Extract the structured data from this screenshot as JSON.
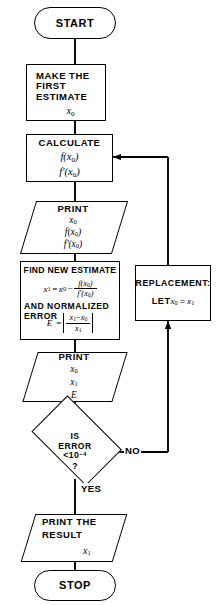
{
  "diagram": {
    "stroke_color": "#000000",
    "background_color": "#ffffff"
  },
  "nodes": {
    "start": {
      "label": "START",
      "shape": "terminator"
    },
    "make_estimate": {
      "shape": "process",
      "line1": "MAKE THE",
      "line2": "FIRST",
      "line3": "ESTIMATE",
      "line4_base": "x",
      "line4_sub": "0"
    },
    "calculate": {
      "shape": "process",
      "title": "CALCULATE",
      "expr1": "f(x",
      "expr1_sub": "0",
      "expr1_end": ")",
      "expr2": "f'(x",
      "expr2_sub": "0",
      "expr2_end": ")"
    },
    "print_first": {
      "shape": "io",
      "title": "PRINT",
      "line1_base": "x",
      "line1_sub": "0",
      "line2": "f(x",
      "line2_sub": "0",
      "line2_end": ")",
      "line3": "f'(x",
      "line3_sub": "0",
      "line3_end": ")"
    },
    "find_new_estimate": {
      "shape": "process",
      "title": "FIND NEW ESTIMATE",
      "eq_lhs_base": "x",
      "eq_lhs_sub": "1",
      "eq_equals": "=",
      "eq_rhs_base": "x",
      "eq_rhs_sub": "0",
      "eq_minus": "−",
      "frac_num": "f(x",
      "frac_num_sub": "0",
      "frac_num_end": ")",
      "frac_den": "f'(x",
      "frac_den_sub": "0",
      "frac_den_end": ")",
      "and_line1": "AND NORMALIZED",
      "and_line2": "ERROR",
      "err_lhs": "E",
      "err_equals": "=",
      "err_num_a": "x",
      "err_num_a_sub": "1",
      "err_num_minus": "−",
      "err_num_b": "x",
      "err_num_b_sub": "0",
      "err_den": "x",
      "err_den_sub": "1"
    },
    "print_second": {
      "shape": "io",
      "title": "PRINT",
      "line1_base": "x",
      "line1_sub": "0",
      "line2_base": "x",
      "line2_sub": "1",
      "line3": "E"
    },
    "decision": {
      "shape": "decision",
      "line1": "IS",
      "line2": "ERROR",
      "line3_base": "<10",
      "line3_sup": "−4",
      "line4": "?"
    },
    "replacement": {
      "shape": "process",
      "line1": "REPLACEMENT:",
      "line2_prefix": "LET ",
      "line2_a": "x",
      "line2_a_sub": "0",
      "line2_eq": "=",
      "line2_b": "x",
      "line2_b_sub": "1"
    },
    "print_result": {
      "shape": "io",
      "line1": "PRINT THE",
      "line2": "RESULT",
      "line3_base": "x",
      "line3_sub": "1"
    },
    "stop": {
      "label": "STOP",
      "shape": "terminator"
    }
  },
  "edge_labels": {
    "no": "NO",
    "yes": "YES"
  }
}
